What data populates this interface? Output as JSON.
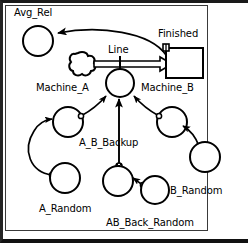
{
  "diagram": {
    "style": {
      "stroke_color": "#000000",
      "background_color": "#ffffff",
      "frame_color": "#1a1a1a",
      "panel_border_color": "#3a3a3a"
    },
    "labels": {
      "avg_rel": "Avg_Rel",
      "finished": "Finished",
      "line": "Line",
      "machine_a": "Machine_A",
      "machine_b": "Machine_B",
      "a_b_backup": "A_B_Backup",
      "a_random": "A_Random",
      "b_random": "B_Random",
      "ab_back_random": "AB_Back_Random"
    },
    "nodes": [
      {
        "id": "avg_rel",
        "label": "Avg_Rel",
        "shape": "circle",
        "cx": 38,
        "cy": 41,
        "r": 15
      },
      {
        "id": "source_cloud",
        "label": "",
        "shape": "cloud",
        "cx": 83,
        "cy": 64,
        "r": 11
      },
      {
        "id": "finished",
        "label": "Finished",
        "shape": "rectangle",
        "x": 166,
        "y": 48,
        "w": 37,
        "h": 30
      },
      {
        "id": "center_place",
        "label": "",
        "shape": "circle",
        "cx": 120,
        "cy": 83,
        "r": 14
      },
      {
        "id": "machine_a",
        "label": "Machine_A",
        "shape": "circle",
        "cx": 68,
        "cy": 122,
        "r": 15
      },
      {
        "id": "machine_b",
        "label": "Machine_B",
        "shape": "circle",
        "cx": 172,
        "cy": 122,
        "r": 15
      },
      {
        "id": "a_random",
        "label": "A_Random",
        "shape": "circle",
        "cx": 65,
        "cy": 178,
        "r": 15
      },
      {
        "id": "b_random",
        "label": "B_Random",
        "shape": "circle",
        "cx": 205,
        "cy": 157,
        "r": 15
      },
      {
        "id": "ab_back_random",
        "label": "AB_Back_Random",
        "shape": "circle",
        "cx": 118,
        "cy": 181,
        "r": 15
      },
      {
        "id": "b_back_small",
        "label": "",
        "shape": "circle",
        "cx": 155,
        "cy": 190,
        "r": 14
      }
    ],
    "arcs": [
      {
        "from": "finished",
        "to": "avg_rel",
        "type": "curve",
        "arrowhead": true,
        "marker": false
      },
      {
        "from": "source_cloud",
        "to": "finished",
        "type": "thick",
        "arrowhead": true,
        "marker": false
      },
      {
        "from": "machine_a",
        "to": "center_place",
        "type": "curve",
        "arrowhead": true,
        "marker": true
      },
      {
        "from": "machine_b",
        "to": "center_place",
        "type": "curve",
        "arrowhead": true,
        "marker": true
      },
      {
        "from": "ab_back_random",
        "to": "center_place",
        "type": "line",
        "arrowhead": true,
        "marker": true
      },
      {
        "from": "a_random",
        "to": "machine_a",
        "type": "curve",
        "arrowhead": true,
        "marker": true
      },
      {
        "from": "b_random",
        "to": "machine_b",
        "type": "curve",
        "arrowhead": true,
        "marker": true
      },
      {
        "from": "b_back_small",
        "to": "ab_back_random",
        "type": "curve",
        "arrowhead": true,
        "marker": true
      },
      {
        "from": "center_place",
        "to": "line",
        "type": "tick",
        "arrowhead": false,
        "marker": false
      }
    ]
  }
}
